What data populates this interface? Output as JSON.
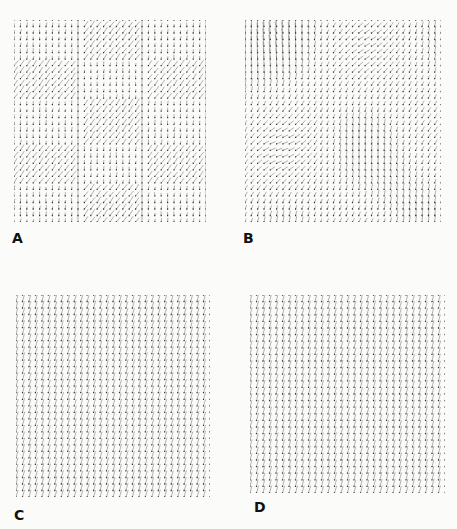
{
  "figure": {
    "background": "#fbfbfa",
    "vector_color": "#555555",
    "dot_color": "#333333",
    "panels": [
      {
        "id": "A",
        "label": "A",
        "x": 14,
        "y": 20,
        "width": 192,
        "height": 202,
        "cols": 31,
        "rows": 32,
        "pattern": "checkerboard",
        "block_cols": 3,
        "block_rows": 5,
        "label_x": 12,
        "label_y": 230,
        "description": "Block-structured field: alternating regions of short near-vertical vectors and long diagonal vectors"
      },
      {
        "id": "B",
        "label": "B",
        "x": 245,
        "y": 20,
        "width": 196,
        "height": 202,
        "cols": 32,
        "rows": 32,
        "pattern": "smooth",
        "label_x": 243,
        "label_y": 230,
        "description": "Smoothly varying field with swirling diagonal regions"
      },
      {
        "id": "C",
        "label": "C",
        "x": 16,
        "y": 295,
        "width": 194,
        "height": 202,
        "cols": 31,
        "rows": 32,
        "pattern": "uniform",
        "angle_deg": 60,
        "label_x": 14,
        "label_y": 507,
        "description": "Uniform field of parallel diagonal vectors"
      },
      {
        "id": "D",
        "label": "D",
        "x": 250,
        "y": 295,
        "width": 195,
        "height": 198,
        "cols": 31,
        "rows": 31,
        "pattern": "uniform",
        "angle_deg": 62,
        "label_x": 254,
        "label_y": 499,
        "description": "Uniform field of parallel diagonal vectors"
      }
    ]
  }
}
